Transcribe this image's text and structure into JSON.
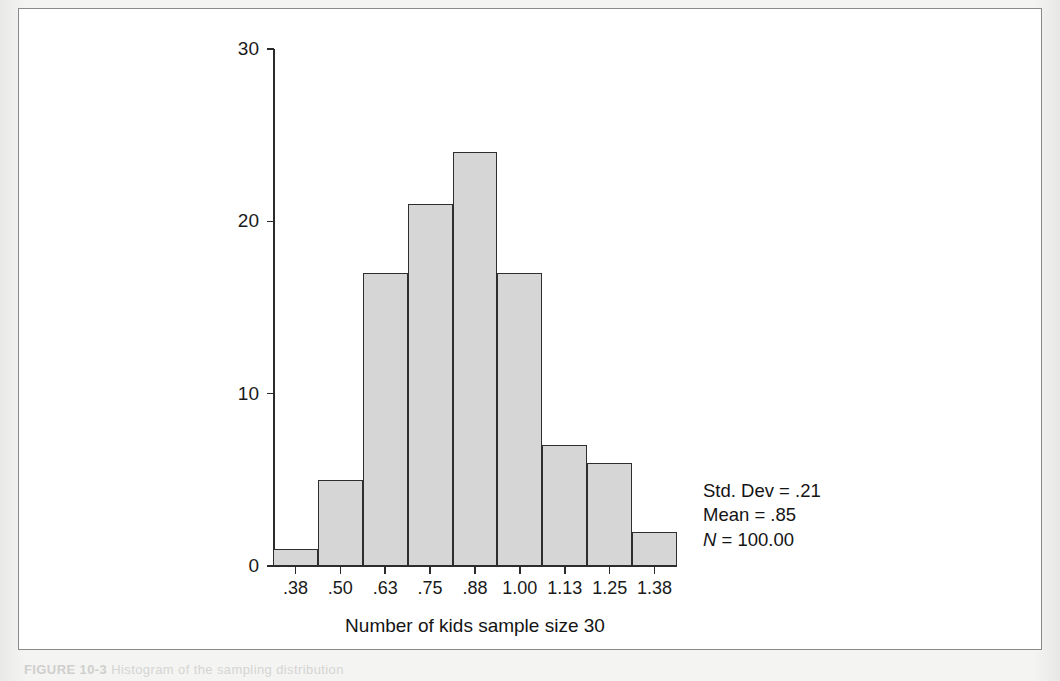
{
  "figure": {
    "caption_label": "FIGURE 10-3",
    "caption_text": "Histogram of the sampling distribution",
    "background_color": "#f2f2f0",
    "frame_border_color": "#8a8a8a"
  },
  "chart_data": {
    "type": "bar",
    "title": "",
    "subtitle": "",
    "xlabel": "Number of kids sample size 30",
    "ylabel": "",
    "categories": [
      ".38",
      ".50",
      ".63",
      ".75",
      ".88",
      "1.00",
      "1.13",
      "1.25",
      "1.38"
    ],
    "values": [
      1,
      5,
      17,
      21,
      24,
      17,
      7,
      6,
      2
    ],
    "ylim": [
      0,
      30
    ],
    "yticks": [
      0,
      10,
      20,
      30
    ],
    "ytick_labels": [
      "0",
      "10",
      "20",
      "30"
    ],
    "grid": false,
    "legend": null,
    "bar_fill_color": "#d6d6d6",
    "bar_edge_color": "#2e2e2e",
    "axis_color": "#2b2b2b",
    "annotations": [
      "Std. Dev = .21",
      "Mean = .85",
      "N = 100.00"
    ]
  },
  "stats": {
    "std_dev_label": "Std. Dev = .21",
    "mean_label": "Mean = .85",
    "n_symbol": "N",
    "n_value": " = 100.00"
  }
}
